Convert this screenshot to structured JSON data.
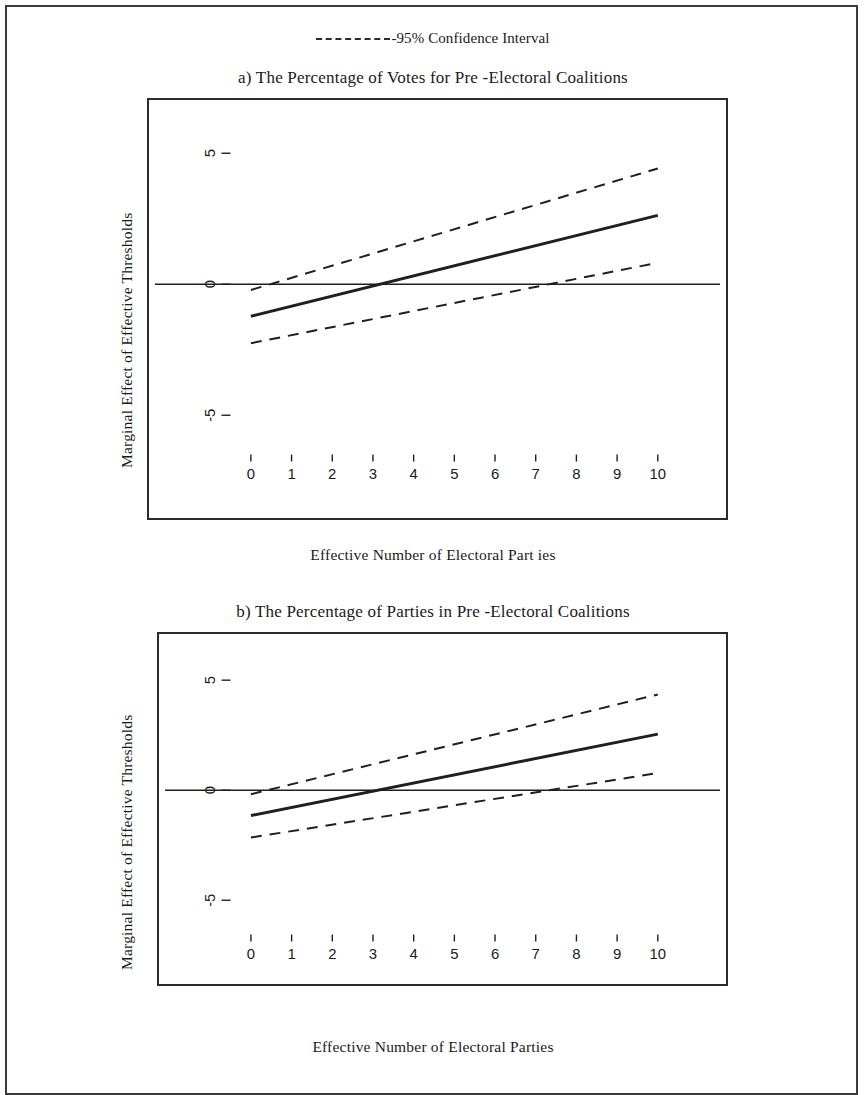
{
  "legend": {
    "dash_icon": "dashed-line-icon",
    "label": "-95% Confidence Interval"
  },
  "panels": [
    {
      "id": "a",
      "title": "a) The Percentage of Votes for Pre -Electoral Coalitions",
      "xlabel": "Effective Number of Electoral Part ies",
      "ylabel": "Marginal Effect of Effective Thresholds"
    },
    {
      "id": "b",
      "title": "b) The Percentage of Parties in Pre -Electoral Coalitions",
      "xlabel": "Effective Number of Electoral Parties",
      "ylabel": "Marginal Effect of Effective Thresholds"
    }
  ],
  "chart_data": [
    {
      "type": "line",
      "title": "a) The Percentage of Votes for Pre -Electoral Coalitions",
      "xlabel": "Effective Number of Electoral Part ies",
      "ylabel": "Marginal Effect of Effective Thresholds",
      "xlim": [
        -0.6,
        10.7
      ],
      "ylim": [
        -6.2,
        6.2
      ],
      "xticks": [
        0,
        1,
        2,
        3,
        4,
        5,
        6,
        7,
        8,
        9,
        10
      ],
      "xticklabels": [
        "0",
        "1",
        "2",
        "3",
        "4",
        "5",
        "6",
        "7",
        "8",
        "9",
        "10"
      ],
      "yticks": [
        -5,
        0,
        5
      ],
      "yticklabels": [
        "-5",
        "0",
        "5"
      ],
      "grid": false,
      "legend_position": "above-figure",
      "zero_line": 0,
      "x": [
        0,
        10
      ],
      "series": [
        {
          "name": "Marginal effect",
          "style": "solid",
          "values": [
            -1.22,
            2.63
          ]
        },
        {
          "name": "95% Confidence Interval upper",
          "style": "dashed",
          "values": [
            -0.22,
            4.42
          ]
        },
        {
          "name": "95% Confidence Interval lower",
          "style": "dashed",
          "values": [
            -2.25,
            0.82
          ]
        }
      ]
    },
    {
      "type": "line",
      "title": "b) The Percentage of Parties in Pre -Electoral Coalitions",
      "xlabel": "Effective Number of Electoral Parties",
      "ylabel": "Marginal Effect of Effective Thresholds",
      "xlim": [
        -0.6,
        10.7
      ],
      "ylim": [
        -6.2,
        6.2
      ],
      "xticks": [
        0,
        1,
        2,
        3,
        4,
        5,
        6,
        7,
        8,
        9,
        10
      ],
      "xticklabels": [
        "0",
        "1",
        "2",
        "3",
        "4",
        "5",
        "6",
        "7",
        "8",
        "9",
        "10"
      ],
      "yticks": [
        -5,
        0,
        5
      ],
      "yticklabels": [
        "-5",
        "0",
        "5"
      ],
      "grid": false,
      "legend_position": "above-figure",
      "zero_line": 0,
      "x": [
        0,
        10
      ],
      "series": [
        {
          "name": "Marginal effect",
          "style": "solid",
          "values": [
            -1.15,
            2.55
          ]
        },
        {
          "name": "95% Confidence Interval upper",
          "style": "dashed",
          "values": [
            -0.18,
            4.35
          ]
        },
        {
          "name": "95% Confidence Interval lower",
          "style": "dashed",
          "values": [
            -2.15,
            0.78
          ]
        }
      ]
    }
  ],
  "colors": {
    "line": "#1f1f1f",
    "frame": "#2b2b2b",
    "text": "#1a1a1a",
    "background": "#ffffff"
  }
}
